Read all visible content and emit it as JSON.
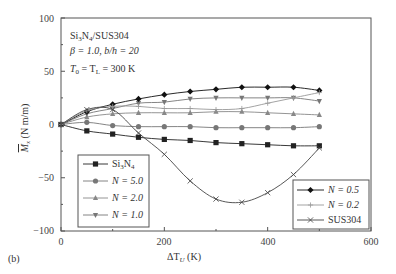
{
  "chart_data": {
    "type": "line",
    "panel_label": "(b)",
    "title": "",
    "xlabel": "ΔT_U (K)",
    "ylabel": "M̄_x (N m/m)",
    "xlim": [
      0,
      600
    ],
    "ylim": [
      -100,
      100
    ],
    "xticks": [
      0,
      200,
      400,
      600
    ],
    "yticks": [
      -100,
      -50,
      0,
      50,
      100
    ],
    "grid": false,
    "annotations": [
      "Si3N4/SUS304",
      "β = 1.0, b/h = 20",
      "T0 = TL = 300 K"
    ],
    "x": [
      0,
      50,
      100,
      150,
      200,
      250,
      300,
      350,
      400,
      450,
      500
    ],
    "series": [
      {
        "name": "Si3N4",
        "marker": "square",
        "color": "#222222",
        "values": [
          0,
          -6,
          -9,
          -12,
          -14,
          -15,
          -17,
          -18,
          -19,
          -20,
          -20
        ]
      },
      {
        "name": "N = 5.0",
        "marker": "circle",
        "color": "#777777",
        "values": [
          0,
          2,
          -1,
          -2,
          -2,
          -2,
          -3,
          -3,
          -3,
          -3,
          -2
        ]
      },
      {
        "name": "N = 2.0",
        "marker": "triangle-up",
        "color": "#888888",
        "values": [
          0,
          7,
          10,
          11,
          11,
          11,
          12,
          12,
          11,
          10,
          9
        ]
      },
      {
        "name": "N = 1.0",
        "marker": "triangle-down",
        "color": "#777777",
        "values": [
          0,
          10,
          15,
          20,
          21,
          24,
          25,
          25,
          25,
          25,
          22
        ]
      },
      {
        "name": "N = 0.5",
        "marker": "diamond",
        "color": "#111111",
        "values": [
          0,
          12,
          19,
          24,
          28,
          31,
          33,
          35,
          35,
          35,
          32
        ]
      },
      {
        "name": "N = 0.2",
        "marker": "plus",
        "color": "#999999",
        "values": [
          0,
          13,
          17,
          17,
          15,
          15,
          14,
          15,
          20,
          25,
          30
        ]
      },
      {
        "name": "SUS304",
        "marker": "x",
        "color": "#444444",
        "values": [
          0,
          14,
          14,
          -8,
          -28,
          -53,
          -70,
          -73,
          -64,
          -47,
          -22
        ]
      }
    ],
    "legend": [
      {
        "position": "lower-left",
        "entries": [
          "Si3N4",
          "N = 5.0",
          "N = 2.0",
          "N = 1.0"
        ]
      },
      {
        "position": "lower-right",
        "entries": [
          "N = 0.5",
          "N = 0.2",
          "SUS304"
        ]
      }
    ]
  },
  "labels": {
    "panel": "(b)",
    "x_axis": "ΔT",
    "x_axis_sub": "U",
    "x_axis_unit": " (K)",
    "y_axis": "M",
    "y_axis_sub": "x",
    "y_axis_unit": " (N m/m)",
    "ann1_a": "Si",
    "ann1_b": "3",
    "ann1_c": "N",
    "ann1_d": "4",
    "ann1_e": "/SUS304",
    "ann2": "β = 1.0, b/h = 20",
    "ann3_a": "T",
    "ann3_b": "0",
    "ann3_c": " = T",
    "ann3_d": "L",
    "ann3_e": " = 300 K",
    "leg_si_a": "Si",
    "leg_si_b": "3",
    "leg_si_c": "N",
    "leg_si_d": "4",
    "leg_n50": "N = 5.0",
    "leg_n20": "N = 2.0",
    "leg_n10": "N = 1.0",
    "leg_n05": "N = 0.5",
    "leg_n02": "N = 0.2",
    "leg_sus": "SUS304",
    "xt0": "0",
    "xt1": "200",
    "xt2": "400",
    "xt3": "600",
    "yt0": "100",
    "yt1": "50",
    "yt2": "0",
    "yt3": "−50",
    "yt4": "−100"
  }
}
